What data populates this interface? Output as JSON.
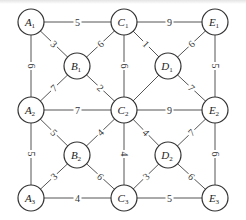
{
  "diagram": {
    "type": "weighted-undirected-graph",
    "colors": {
      "edge": "#555555",
      "node_stroke": "#333333",
      "text": "#222222",
      "background": "#ffffff"
    },
    "nodes": [
      {
        "id": "A1",
        "letter": "A",
        "sub": "1",
        "x": 31,
        "y": 22
      },
      {
        "id": "C1",
        "letter": "C",
        "sub": "1",
        "x": 124,
        "y": 22
      },
      {
        "id": "E1",
        "letter": "E",
        "sub": "1",
        "x": 215,
        "y": 22
      },
      {
        "id": "B1",
        "letter": "B",
        "sub": "1",
        "x": 77,
        "y": 66
      },
      {
        "id": "D1",
        "letter": "D",
        "sub": "1",
        "x": 168,
        "y": 66
      },
      {
        "id": "A2",
        "letter": "A",
        "sub": "2",
        "x": 31,
        "y": 110
      },
      {
        "id": "C2",
        "letter": "C",
        "sub": "2",
        "x": 124,
        "y": 110
      },
      {
        "id": "E2",
        "letter": "E",
        "sub": "2",
        "x": 215,
        "y": 110
      },
      {
        "id": "B2",
        "letter": "B",
        "sub": "2",
        "x": 77,
        "y": 155
      },
      {
        "id": "D2",
        "letter": "D",
        "sub": "2",
        "x": 168,
        "y": 155
      },
      {
        "id": "A3",
        "letter": "A",
        "sub": "3",
        "x": 31,
        "y": 198
      },
      {
        "id": "C3",
        "letter": "C",
        "sub": "3",
        "x": 124,
        "y": 198
      },
      {
        "id": "E3",
        "letter": "E",
        "sub": "3",
        "x": 215,
        "y": 198
      }
    ],
    "edges": [
      {
        "from": "A1",
        "to": "C1",
        "weight": "5"
      },
      {
        "from": "C1",
        "to": "E1",
        "weight": "9"
      },
      {
        "from": "A1",
        "to": "B1",
        "weight": "3"
      },
      {
        "from": "B1",
        "to": "C1",
        "weight": "6"
      },
      {
        "from": "C1",
        "to": "D1",
        "weight": "1"
      },
      {
        "from": "D1",
        "to": "E1",
        "weight": "6"
      },
      {
        "from": "A1",
        "to": "A2",
        "weight": "6"
      },
      {
        "from": "C1",
        "to": "C2",
        "weight": "6"
      },
      {
        "from": "E1",
        "to": "E2",
        "weight": "5"
      },
      {
        "from": "A2",
        "to": "B1",
        "weight": "7"
      },
      {
        "from": "B1",
        "to": "C2",
        "weight": "2"
      },
      {
        "from": "C2",
        "to": "D1",
        "weight": ""
      },
      {
        "from": "D1",
        "to": "E2",
        "weight": "7"
      },
      {
        "from": "A2",
        "to": "C2",
        "weight": "7"
      },
      {
        "from": "C2",
        "to": "E2",
        "weight": "9"
      },
      {
        "from": "A2",
        "to": "B2",
        "weight": "5"
      },
      {
        "from": "B2",
        "to": "C2",
        "weight": "4"
      },
      {
        "from": "C2",
        "to": "D2",
        "weight": "4"
      },
      {
        "from": "D2",
        "to": "E2",
        "weight": "7"
      },
      {
        "from": "A2",
        "to": "A3",
        "weight": "5"
      },
      {
        "from": "C2",
        "to": "C3",
        "weight": "4"
      },
      {
        "from": "E2",
        "to": "E3",
        "weight": "6"
      },
      {
        "from": "A3",
        "to": "B2",
        "weight": "3"
      },
      {
        "from": "B2",
        "to": "C3",
        "weight": "6"
      },
      {
        "from": "C3",
        "to": "D2",
        "weight": "3"
      },
      {
        "from": "D2",
        "to": "E3",
        "weight": "6"
      },
      {
        "from": "A3",
        "to": "C3",
        "weight": "4"
      },
      {
        "from": "C3",
        "to": "E3",
        "weight": "5"
      }
    ]
  }
}
